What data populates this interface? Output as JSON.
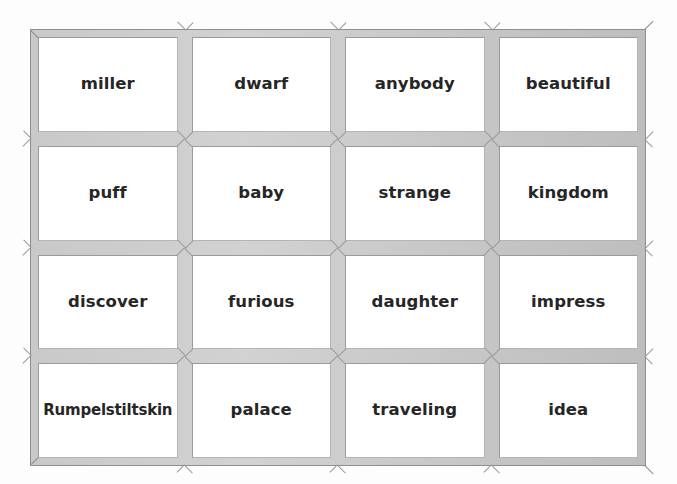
{
  "grid": {
    "rows": 4,
    "columns": 4,
    "cells": [
      [
        {
          "word": "miller"
        },
        {
          "word": "dwarf"
        },
        {
          "word": "anybody"
        },
        {
          "word": "beautiful"
        }
      ],
      [
        {
          "word": "puff"
        },
        {
          "word": "baby"
        },
        {
          "word": "strange"
        },
        {
          "word": "kingdom"
        }
      ],
      [
        {
          "word": "discover"
        },
        {
          "word": "furious"
        },
        {
          "word": "daughter"
        },
        {
          "word": "impress"
        }
      ],
      [
        {
          "word": "Rumpelstiltskin"
        },
        {
          "word": "palace"
        },
        {
          "word": "traveling"
        },
        {
          "word": "idea"
        }
      ]
    ]
  },
  "colors": {
    "page_background": "#fdfdfd",
    "frame_fill": "#c9c9c9",
    "frame_edge": "#8e8e8e",
    "card_background": "#ffffff",
    "card_border_dark": "#9a9a9a",
    "card_border_light": "#b4b4b4",
    "text": "#262626"
  }
}
